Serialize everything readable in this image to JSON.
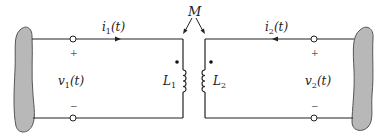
{
  "diagram": {
    "mutual_label": "M",
    "left": {
      "current_label": "i",
      "current_sub": "1",
      "current_arg": "(t)",
      "voltage_label": "v",
      "voltage_sub": "1",
      "voltage_arg": "(t)",
      "inductor_label": "L",
      "inductor_sub": "1",
      "plus": "+",
      "minus": "−"
    },
    "right": {
      "current_label": "i",
      "current_sub": "2",
      "current_arg": "(t)",
      "voltage_label": "v",
      "voltage_sub": "2",
      "voltage_arg": "(t)",
      "inductor_label": "L",
      "inductor_sub": "2",
      "plus": "+",
      "minus": "−"
    },
    "colors": {
      "wire": "#222222",
      "network_fill": "#b8b8b8",
      "network_stroke": "#555555"
    }
  }
}
